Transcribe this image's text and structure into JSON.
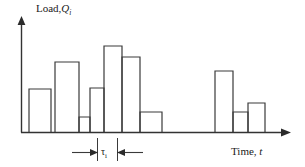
{
  "figure": {
    "y_axis_label": {
      "text": "Load,",
      "symbol": "Q",
      "subscript": "i"
    },
    "x_axis_label": {
      "text": "Time,",
      "symbol": "t"
    },
    "interval_annotation": {
      "symbol": "τ",
      "subscript": "i"
    },
    "stroke_color": "#333333",
    "background_color": "#ffffff"
  },
  "chart_data": {
    "type": "bar",
    "title": "",
    "xlabel": "Time, t",
    "ylabel": "Load, Q_i",
    "grid": false,
    "legend": null,
    "axis": {
      "origin_x": 21,
      "baseline_y": 132,
      "y_top": 17,
      "x_right": 290,
      "xlim": [
        21,
        290
      ],
      "ylim": [
        0,
        100
      ]
    },
    "note": "Stepwise load blocks of equal duration tau_i; heights are relative load values read off the plot.",
    "categories": [
      "1",
      "2",
      "3",
      "4",
      "5",
      "6",
      "7",
      "8",
      "9",
      "10",
      "11",
      "12",
      "13"
    ],
    "values": [
      0,
      48,
      74,
      16,
      49,
      93,
      81,
      22,
      0,
      0,
      66,
      22,
      32
    ],
    "bars": [
      {
        "index": 1,
        "x_left": 21,
        "x_right": 29,
        "top_y": 132,
        "height": 0,
        "value": 0
      },
      {
        "index": 2,
        "x_left": 29,
        "x_right": 51,
        "top_y": 89,
        "height": 43,
        "value": 48
      },
      {
        "index": 3,
        "x_left": 51,
        "x_right": 55,
        "top_y": 132,
        "height": 0,
        "value": 0
      },
      {
        "index": 4,
        "x_left": 55,
        "x_right": 79,
        "top_y": 62,
        "height": 70,
        "value": 74
      },
      {
        "index": 5,
        "x_left": 79,
        "x_right": 90,
        "top_y": 117,
        "height": 15,
        "value": 16
      },
      {
        "index": 6,
        "x_left": 90,
        "x_right": 104,
        "top_y": 88,
        "height": 44,
        "value": 49
      },
      {
        "index": 7,
        "x_left": 104,
        "x_right": 122,
        "top_y": 46,
        "height": 86,
        "value": 93
      },
      {
        "index": 8,
        "x_left": 122,
        "x_right": 140,
        "top_y": 57,
        "height": 75,
        "value": 81
      },
      {
        "index": 9,
        "x_left": 140,
        "x_right": 162,
        "top_y": 112,
        "height": 20,
        "value": 22
      },
      {
        "index": 10,
        "x_left": 162,
        "x_right": 215,
        "top_y": 132,
        "height": 0,
        "value": 0
      },
      {
        "index": 11,
        "x_left": 215,
        "x_right": 233,
        "top_y": 71,
        "height": 61,
        "value": 66
      },
      {
        "index": 12,
        "x_left": 233,
        "x_right": 248,
        "top_y": 112,
        "height": 20,
        "value": 22
      },
      {
        "index": 13,
        "x_left": 248,
        "x_right": 265,
        "top_y": 103,
        "height": 29,
        "value": 32
      }
    ],
    "interval_markers": {
      "left_tick_x": 97,
      "right_tick_x": 117,
      "tick_top_y": 138,
      "tick_bottom_y": 160
    }
  }
}
